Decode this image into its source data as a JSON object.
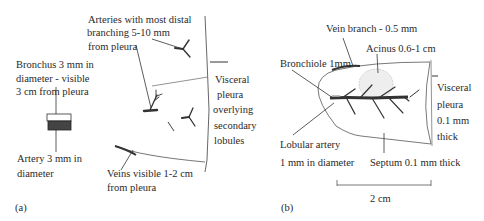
{
  "panel_a": {
    "tag": "(a)",
    "arteries_label": [
      "Arteries with most distal",
      "branching 5-10 mm",
      "from pleura"
    ],
    "bronchus_label": [
      "Bronchus 3 mm in",
      "diameter - visible",
      "3 cm from pleura"
    ],
    "artery_label": [
      "Artery 3 mm in",
      "diameter"
    ],
    "veins_label": [
      "Veins visible 1-2 cm",
      "from pleura"
    ],
    "pleura_label": [
      "Visceral",
      "pleura",
      "overlying",
      "secondary",
      "lobules"
    ]
  },
  "panel_b": {
    "tag": "(b)",
    "vein_branch_label": "Vein branch - 0.5 mm",
    "acinus_label": "Acinus 0.6-1 cm",
    "bronchiole_label": "Bronchiole 1mm",
    "lobular_artery_label": [
      "Lobular artery",
      "1 mm in diameter"
    ],
    "septum_label": "Septum 0.1 mm thick",
    "pleura_label": [
      "Visceral",
      "pleura",
      "0.1 mm",
      "thick"
    ],
    "scale_label": "2 cm"
  }
}
